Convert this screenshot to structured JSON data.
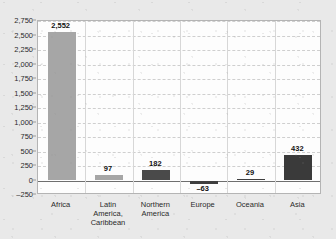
{
  "chart_data": {
    "type": "bar",
    "title": "",
    "subtitle": "",
    "xlabel": "",
    "ylabel": "",
    "categories": [
      "Africa",
      "Latin America, Caribbean",
      "Northern America",
      "Europe",
      "Oceania",
      "Asia"
    ],
    "category_lines": [
      [
        "Africa"
      ],
      [
        "Latin America,",
        "Caribbean"
      ],
      [
        "Northern",
        "America"
      ],
      [
        "Europe"
      ],
      [
        "Oceania"
      ],
      [
        "Asia"
      ]
    ],
    "values": [
      2552,
      97,
      182,
      -63,
      29,
      432
    ],
    "value_labels": [
      "2,552",
      "97",
      "182",
      "–63",
      "29",
      "432"
    ],
    "bar_colors": [
      "#a6a6a6",
      "#a6a6a6",
      "#4a4a4a",
      "#3f3f3f",
      "#3f3f3f",
      "#3a3a3a"
    ],
    "ylim": [
      -250,
      2750
    ],
    "ytick_values": [
      2750,
      2500,
      2250,
      2000,
      1750,
      1500,
      1250,
      1000,
      750,
      500,
      250,
      0,
      -250
    ],
    "ytick_labels": [
      "2,750",
      "2,500",
      "2,250",
      "2,000",
      "1,750",
      "1,500",
      "1,250",
      "1,000",
      "750",
      "500",
      "250",
      "0",
      "–250"
    ],
    "grid": true,
    "grid_color": "#cfcfcf",
    "zero_line_color": "#6e6e6e",
    "legend": "none",
    "plot_background": "#fdfdfd",
    "figure_background": "#e9e9e9",
    "frame_color": "#b4b4b4"
  }
}
